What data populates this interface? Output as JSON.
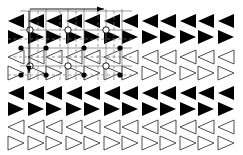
{
  "figure": {
    "width": 243,
    "height": 155,
    "background_color": "#ffffff",
    "ink_color": "#000000",
    "outline_color": "#3a3a3a",
    "lattice_color": "#707070"
  },
  "array": {
    "description": "8 rows by 6 columns of bowtie (hourglass) elements, each formed by two opposing triangles meeting near a central gap",
    "rows": 8,
    "columns": 6,
    "column_x": [
      8,
      46,
      84,
      122,
      160,
      198
    ],
    "column_pitch": 38,
    "element_width": 36,
    "row_y": [
      14,
      30,
      50,
      66,
      86,
      102,
      120,
      136
    ],
    "row_pitch_within_pair": 16,
    "element_height": 14,
    "center_gap": 2,
    "row_styles": [
      {
        "index": 1,
        "y": 14,
        "fill": "solid",
        "color": "#000000",
        "orientation": "left-apex-right-base"
      },
      {
        "index": 2,
        "y": 30,
        "fill": "solid",
        "color": "#000000",
        "orientation": "left-base-right-apex"
      },
      {
        "index": 3,
        "y": 50,
        "fill": "outline",
        "color": "#3a3a3a",
        "orientation": "left-apex-right-base"
      },
      {
        "index": 4,
        "y": 66,
        "fill": "outline",
        "color": "#3a3a3a",
        "orientation": "left-base-right-apex"
      },
      {
        "index": 5,
        "y": 86,
        "fill": "solid",
        "color": "#000000",
        "orientation": "left-apex-right-base"
      },
      {
        "index": 6,
        "y": 102,
        "fill": "solid",
        "color": "#000000",
        "orientation": "left-base-right-apex"
      },
      {
        "index": 7,
        "y": 120,
        "fill": "outline",
        "color": "#3a3a3a",
        "orientation": "left-apex-right-base"
      },
      {
        "index": 8,
        "y": 136,
        "fill": "outline",
        "color": "#3a3a3a",
        "orientation": "left-base-right-apex"
      }
    ]
  },
  "lattice": {
    "description": "Thin grey lattice overlay covering the upper-left region, with solid unit-cell lines, dashed mid-lines, hollow circular nodes at cell corners and small filled circular nodes at bowtie centres",
    "extent": {
      "x0": 20,
      "y0": 9,
      "x1": 132,
      "y1": 80
    },
    "solid_horizontal_lines_y": [
      11,
      30,
      48,
      66
    ],
    "dashed_horizontal_lines_y": [
      39,
      57,
      75
    ],
    "solid_vertical_lines_x": [
      30,
      46,
      68,
      84,
      106,
      122
    ],
    "dashed_vertical_lines_x": [
      38,
      60,
      76,
      98,
      114
    ],
    "hollow_nodes": [
      {
        "x": 30,
        "y": 30
      },
      {
        "x": 68,
        "y": 30
      },
      {
        "x": 106,
        "y": 30
      },
      {
        "x": 30,
        "y": 66
      },
      {
        "x": 68,
        "y": 66
      },
      {
        "x": 106,
        "y": 66
      }
    ],
    "hollow_node_radius": 3.2,
    "filled_nodes": [
      {
        "x": 21,
        "y": 48
      },
      {
        "x": 46,
        "y": 48
      },
      {
        "x": 84,
        "y": 48
      },
      {
        "x": 120,
        "y": 48
      },
      {
        "x": 21,
        "y": 75
      },
      {
        "x": 46,
        "y": 75
      },
      {
        "x": 84,
        "y": 75
      },
      {
        "x": 120,
        "y": 75
      }
    ],
    "filled_node_radius": 2.6
  },
  "axes": {
    "horizontal_arrow": {
      "label": "",
      "from": {
        "x": 30,
        "y": 9
      },
      "to": {
        "x": 104,
        "y": 9
      },
      "direction": "right",
      "head_length": 7,
      "head_width": 5
    },
    "vertical_arrow": {
      "label": "",
      "from": {
        "x": 29,
        "y": 11
      },
      "to": {
        "x": 29,
        "y": 73
      },
      "direction": "down",
      "head_length": 7,
      "head_width": 5
    }
  }
}
